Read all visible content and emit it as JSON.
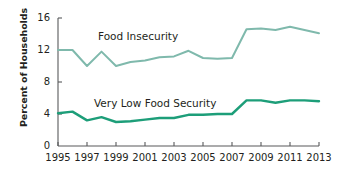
{
  "chart_data": {
    "type": "line",
    "title": "",
    "subtitle": "",
    "xlabel": "",
    "ylabel": "Percent of Households",
    "xlim": [
      1995,
      2013
    ],
    "ylim": [
      0,
      16
    ],
    "grid": false,
    "legend_position": "inline-annotation",
    "x": [
      1995,
      1996,
      1997,
      1998,
      1999,
      2000,
      2001,
      2002,
      2003,
      2004,
      2005,
      2006,
      2007,
      2008,
      2009,
      2010,
      2011,
      2012,
      2013
    ],
    "y_ticks": [
      0,
      4,
      8,
      12,
      16
    ],
    "x_ticks": [
      1995,
      1997,
      1999,
      2001,
      2003,
      2005,
      2007,
      2009,
      2011,
      2013
    ],
    "series": [
      {
        "name": "Food Insecurity",
        "color": "#7FB9AC",
        "values": [
          12.0,
          12.0,
          10.0,
          11.8,
          10.0,
          10.5,
          10.7,
          11.1,
          11.2,
          11.9,
          11.0,
          10.9,
          11.0,
          14.6,
          14.7,
          14.5,
          14.9,
          14.5,
          14.1
        ]
      },
      {
        "name": "Very Low Food Security",
        "color": "#1D9E79",
        "values": [
          4.1,
          4.3,
          3.2,
          3.6,
          3.0,
          3.1,
          3.3,
          3.5,
          3.5,
          3.9,
          3.9,
          4.0,
          4.0,
          5.7,
          5.7,
          5.4,
          5.7,
          5.7,
          5.6
        ]
      }
    ],
    "annotations": [
      {
        "text": "Food Insecurity",
        "x": 2000.2,
        "y": 12.8
      },
      {
        "text": "Very Low Food Security",
        "x": 2000.0,
        "y": 5.1
      }
    ]
  },
  "axis": {
    "y_tick_labels": [
      "0",
      "4",
      "8",
      "12",
      "16"
    ],
    "x_tick_labels": [
      "1995",
      "1997",
      "1999",
      "2001",
      "2003",
      "2005",
      "2007",
      "2009",
      "2011",
      "2013"
    ],
    "y_title": "Percent of Households"
  },
  "colors": {
    "food_insecurity": "#7FB9AC",
    "very_low_food_security": "#1D9E79",
    "axis": "#58595b",
    "text": "#231f20",
    "background": "#ffffff"
  }
}
